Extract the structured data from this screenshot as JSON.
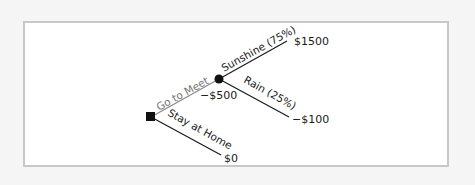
{
  "diagram": {
    "type": "decision-tree",
    "decision_node": {
      "shape": "square"
    },
    "chance_node": {
      "shape": "circle"
    },
    "branches": {
      "go_to_meet": {
        "label": "Go to Meet",
        "cost": "−$500"
      },
      "sunshine": {
        "label": "Sunshine (75%)",
        "payoff": "$1500"
      },
      "rain": {
        "label": "Rain (25%)",
        "payoff": "−$100"
      },
      "stay_at_home": {
        "label": "Stay at Home",
        "payoff": "$0"
      }
    },
    "colors": {
      "line": "#1a1a1a",
      "go_to_meet_line": "#8a8a8a",
      "panel_border": "#c8c8c8",
      "background": "#f5f5f5"
    }
  }
}
